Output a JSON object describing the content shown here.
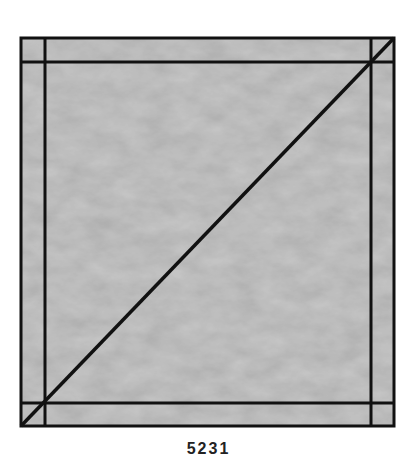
{
  "figure": {
    "outer_square": {
      "x": 21,
      "y": 38,
      "size": 373
    },
    "inner_lines": {
      "left_x": 45,
      "right_x": 371,
      "top_y": 62,
      "bottom_y": 403
    },
    "diagonal": {
      "x1": 21,
      "y1": 426,
      "x2": 394,
      "y2": 38
    },
    "fill_color": "#bcbcbc",
    "line_color": "#111111",
    "line_width": 3
  },
  "caption": {
    "text": "5231"
  }
}
